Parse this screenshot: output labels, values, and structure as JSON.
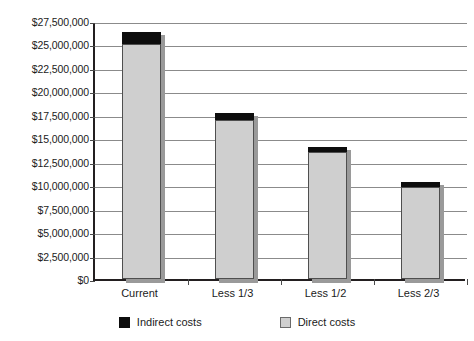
{
  "chart_data": {
    "type": "bar",
    "subtype": "stacked",
    "title": "",
    "xlabel": "",
    "ylabel": "",
    "categories": [
      "Current",
      "Less 1/3",
      "Less 1/2",
      "Less 2/3"
    ],
    "series": [
      {
        "name": "Direct costs",
        "color": "#CFCFCF",
        "values": [
          25000000,
          16900000,
          13500000,
          9800000
        ]
      },
      {
        "name": "Indirect costs",
        "color": "#0D0D0D",
        "values": [
          1400000,
          900000,
          700000,
          700000
        ]
      }
    ],
    "totals": [
      26400000,
      17800000,
      14200000,
      10500000
    ],
    "stack_order": [
      "Direct costs",
      "Indirect costs"
    ],
    "ylim": [
      0,
      27500000
    ],
    "ytick_step": 2500000,
    "ytick_labels": [
      "$27,500,000",
      "$25,000,000",
      "$22,500,000",
      "$20,000,000",
      "$17,500,000",
      "$15,000,000",
      "$12,500,000",
      "$10,000,000",
      "$7,500,000",
      "$5,000,000",
      "$2,500,000",
      "$0"
    ],
    "ytick_values": [
      27500000,
      25000000,
      22500000,
      20000000,
      17500000,
      15000000,
      12500000,
      10000000,
      7500000,
      5000000,
      2500000,
      0
    ],
    "grid": true,
    "grid_axis": "y",
    "legend": {
      "position": "bottom",
      "entries": [
        {
          "label": "Indirect costs",
          "color": "#0D0D0D",
          "swatch": "indirect-swatch"
        },
        {
          "label": "Direct costs",
          "color": "#CFCFCF",
          "swatch": "direct-swatch"
        }
      ]
    },
    "axis_color": "#231F20",
    "grid_color": "#8B8B8B",
    "background": "#FFFFFF"
  }
}
